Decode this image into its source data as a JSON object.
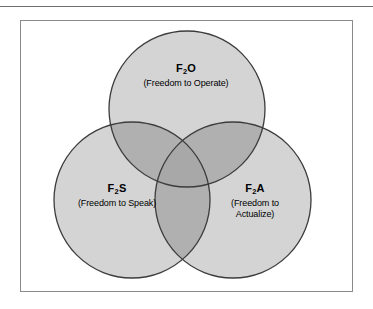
{
  "figure": {
    "type": "venn-diagram-3-set",
    "background_color": "#ffffff",
    "frame_border_color": "#8a8a8a",
    "top_rule_color": "#6f6f6f",
    "circle_fill_color": "#d4d4d4",
    "circle_overlap_color": "#b0b0b0",
    "circle_stroke_color": "#3c3c3c",
    "label_text_color": "#000000"
  },
  "sets": [
    {
      "id": "f2o",
      "position": "top",
      "code_prefix": "F",
      "code_subscript": "2",
      "code_suffix": "O",
      "description_lines": [
        "(Freedom to Operate)"
      ]
    },
    {
      "id": "f2s",
      "position": "bottom-left",
      "code_prefix": "F",
      "code_subscript": "2",
      "code_suffix": "S",
      "description_lines": [
        "(Freedom to Speak)"
      ]
    },
    {
      "id": "f2a",
      "position": "bottom-right",
      "code_prefix": "F",
      "code_subscript": "2",
      "code_suffix": "A",
      "description_lines": [
        "(Freedom to",
        "Actualize)"
      ]
    }
  ]
}
